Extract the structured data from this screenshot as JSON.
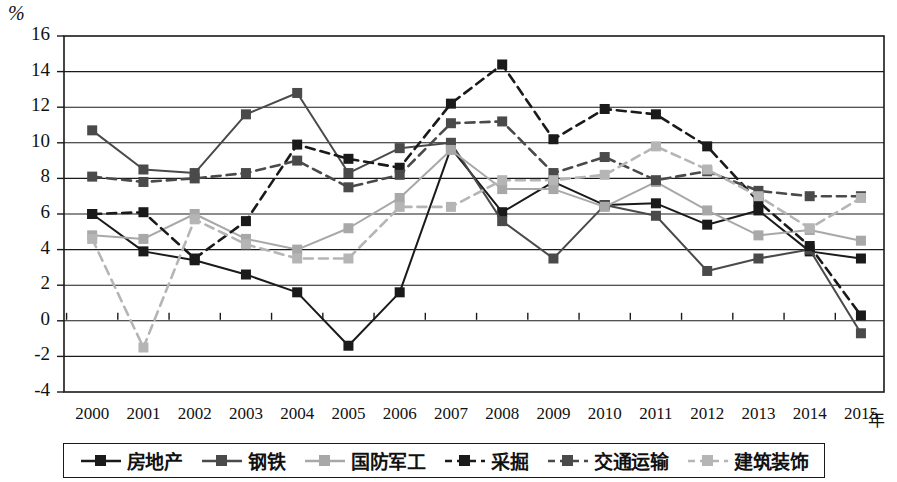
{
  "chart_data": {
    "type": "line",
    "title": "",
    "xlabel": "年",
    "ylabel": "%",
    "ylim": [
      -4,
      16
    ],
    "ytick_step": 2,
    "grid": true,
    "legend_position": "bottom",
    "categories": [
      "2000",
      "2001",
      "2002",
      "2003",
      "2004",
      "2005",
      "2006",
      "2007",
      "2008",
      "2009",
      "2010",
      "2011",
      "2012",
      "2013",
      "2014",
      "2015"
    ],
    "yticks": [
      "16",
      "14",
      "12",
      "10",
      "8",
      "6",
      "4",
      "2",
      "0",
      "-2",
      "-4"
    ],
    "series": [
      {
        "name": "房地产",
        "color": "#1a1a1a",
        "style": "solid",
        "values": [
          6.0,
          3.9,
          3.4,
          2.6,
          1.6,
          -1.4,
          1.6,
          9.7,
          6.1,
          7.8,
          6.5,
          6.6,
          5.4,
          6.2,
          3.9,
          3.5
        ]
      },
      {
        "name": "钢铁",
        "color": "#4a4a4a",
        "style": "solid",
        "values": [
          10.7,
          8.5,
          8.3,
          11.6,
          12.8,
          8.3,
          9.7,
          10.0,
          5.6,
          3.5,
          6.5,
          5.9,
          2.8,
          3.5,
          4.0,
          -0.7
        ]
      },
      {
        "name": "国防军工",
        "color": "#a8a8a8",
        "style": "solid",
        "values": [
          4.8,
          4.6,
          6.0,
          4.6,
          4.0,
          5.2,
          6.9,
          9.6,
          7.4,
          7.4,
          6.4,
          7.8,
          6.2,
          4.8,
          5.1,
          4.5
        ]
      },
      {
        "name": "采掘",
        "color": "#1a1a1a",
        "style": "dashed",
        "values": [
          6.0,
          6.1,
          3.5,
          5.6,
          9.9,
          9.1,
          8.6,
          12.2,
          14.4,
          10.2,
          11.9,
          11.6,
          9.8,
          6.7,
          4.2,
          0.3
        ]
      },
      {
        "name": "交通运输",
        "color": "#4a4a4a",
        "style": "dashed",
        "values": [
          8.1,
          7.8,
          8.0,
          8.3,
          9.0,
          7.5,
          8.2,
          11.1,
          11.2,
          8.3,
          9.2,
          7.9,
          8.4,
          7.3,
          7.0,
          7.0
        ]
      },
      {
        "name": "建筑装饰",
        "color": "#b5b5b5",
        "style": "dashed",
        "values": [
          4.6,
          -1.5,
          5.7,
          4.3,
          3.5,
          3.5,
          6.4,
          6.4,
          7.9,
          7.9,
          8.2,
          9.8,
          8.5,
          7.0,
          5.2,
          6.9
        ]
      }
    ]
  },
  "legend": {
    "items": [
      {
        "label": "房地产"
      },
      {
        "label": "钢铁"
      },
      {
        "label": "国防军工"
      },
      {
        "label": "采掘"
      },
      {
        "label": "交通运输"
      },
      {
        "label": "建筑装饰"
      }
    ]
  }
}
